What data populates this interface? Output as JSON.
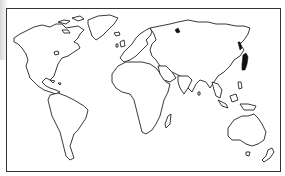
{
  "map": {
    "type": "world-outline-map",
    "colors": {
      "background": "#ffffff",
      "outline": "#222222",
      "frame": "#333333"
    },
    "continents": [
      "north-america",
      "greenland",
      "south-america",
      "europe",
      "africa",
      "asia",
      "australia",
      "new-zealand",
      "japan",
      "madagascar",
      "indonesia",
      "antarctica-absent"
    ]
  }
}
